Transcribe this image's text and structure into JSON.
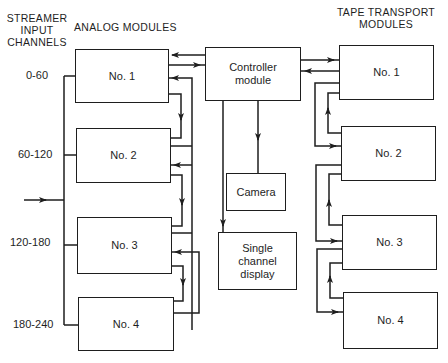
{
  "headers": {
    "streamer_input": "STREAMER\nINPUT\nCHANNELS",
    "streamer_line1": "STREAMER",
    "streamer_line2": "INPUT",
    "streamer_line3": "CHANNELS",
    "analog_modules": "ANALOG MODULES",
    "tape_line1": "TAPE  TRANSPORT",
    "tape_line2": "MODULES"
  },
  "channels": [
    {
      "label": "0-60"
    },
    {
      "label": "60-120"
    },
    {
      "label": "120-180"
    },
    {
      "label": "180-240"
    }
  ],
  "analog_modules": [
    {
      "label": "No. 1"
    },
    {
      "label": "No. 2"
    },
    {
      "label": "No. 3"
    },
    {
      "label": "No. 4"
    }
  ],
  "controller": {
    "label": "Controller\nmodule"
  },
  "camera": {
    "label": "Camera"
  },
  "display": {
    "label": "Single\nchannel\ndisplay"
  },
  "tape_modules": [
    {
      "label": "No. 1"
    },
    {
      "label": "No. 2"
    },
    {
      "label": "No. 3"
    },
    {
      "label": "No. 4"
    }
  ],
  "colors": {
    "line": "#1e1e1e",
    "background": "#ffffff"
  }
}
